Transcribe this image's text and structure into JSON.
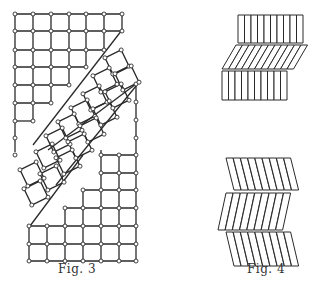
{
  "figures": [
    {
      "id": "fig3",
      "caption": "Fig. 3",
      "description": "Square lattice with nodes, two diagonal shear bands with rotated squares"
    },
    {
      "id": "fig4",
      "caption": "Fig. 4",
      "description": "Rows of rectangular bars: upper shows kink band (sheared rows), lower shows chevron folds"
    }
  ],
  "colors": {
    "line": "#2a2a2a",
    "node_fill": "#ffffff",
    "background": "#ffffff"
  }
}
